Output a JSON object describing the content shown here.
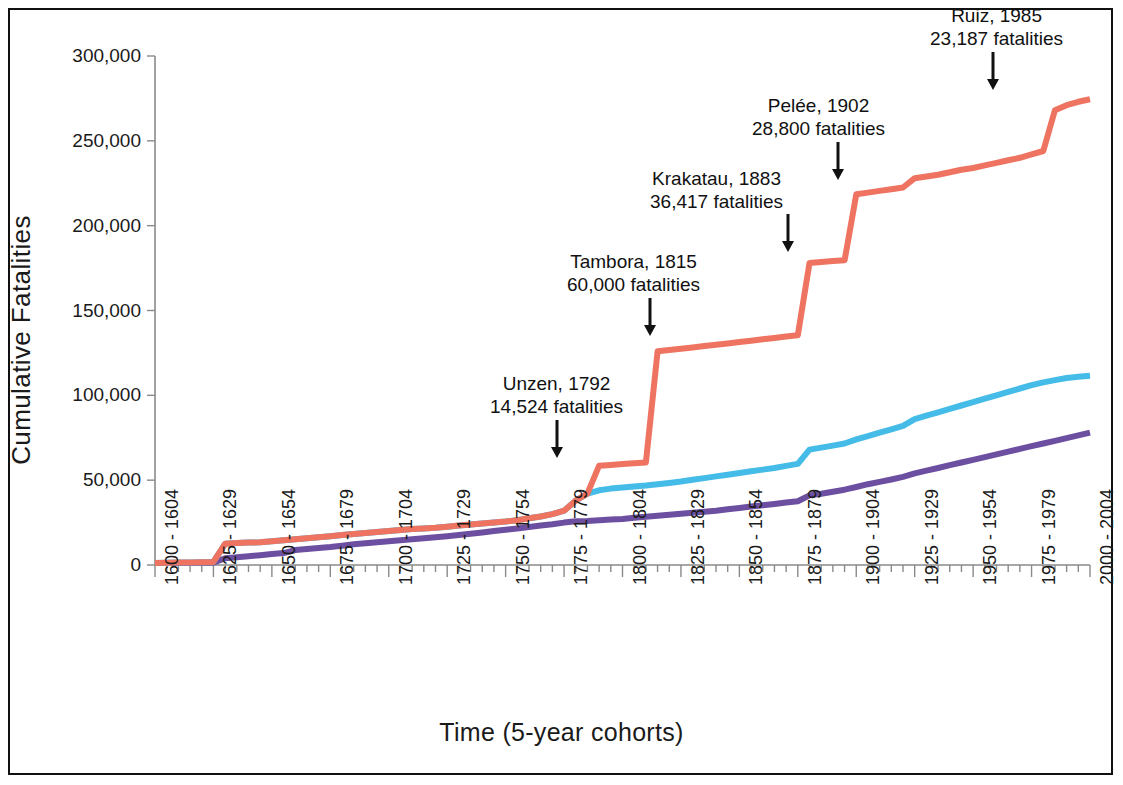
{
  "chart_data": {
    "type": "line",
    "title": "",
    "xlabel": "Time (5-year cohorts)",
    "ylabel": "Cumulative Fatalities",
    "ylim": [
      0,
      300000
    ],
    "ytick_labels": [
      "300,000",
      "250,000",
      "200,000",
      "150,000",
      "100,000",
      "50,000",
      "0"
    ],
    "ytick_values": [
      300000,
      250000,
      200000,
      150000,
      100000,
      50000,
      0
    ],
    "grid": false,
    "legend_position": "none",
    "x_tick_label_step": 5,
    "xtick_labels": [
      "1600 - 1604",
      "1625 - 1629",
      "1650 - 1654",
      "1675 - 1679",
      "1700 - 1704",
      "1725 - 1729",
      "1750 - 1754",
      "1775 - 1779",
      "1800 - 1804",
      "1825 - 1829",
      "1850 - 1854",
      "1875 - 1879",
      "1900 - 1904",
      "1925 - 1929",
      "1950 - 1954",
      "1975 - 1979",
      "2000 - 2004"
    ],
    "categories": [
      "1600 - 1604",
      "1605 - 1609",
      "1610 - 1614",
      "1615 - 1619",
      "1620 - 1624",
      "1625 - 1629",
      "1630 - 1634",
      "1635 - 1639",
      "1640 - 1644",
      "1645 - 1649",
      "1650 - 1654",
      "1655 - 1659",
      "1660 - 1664",
      "1665 - 1669",
      "1670 - 1674",
      "1675 - 1679",
      "1680 - 1684",
      "1685 - 1689",
      "1690 - 1694",
      "1695 - 1699",
      "1700 - 1704",
      "1705 - 1709",
      "1710 - 1714",
      "1715 - 1719",
      "1720 - 1724",
      "1725 - 1729",
      "1730 - 1734",
      "1735 - 1739",
      "1740 - 1744",
      "1745 - 1749",
      "1750 - 1754",
      "1755 - 1759",
      "1760 - 1764",
      "1765 - 1769",
      "1770 - 1774",
      "1775 - 1779",
      "1780 - 1784",
      "1785 - 1789",
      "1790 - 1794",
      "1795 - 1799",
      "1800 - 1804",
      "1805 - 1809",
      "1810 - 1814",
      "1815 - 1819",
      "1820 - 1824",
      "1825 - 1829",
      "1830 - 1834",
      "1835 - 1839",
      "1840 - 1844",
      "1845 - 1849",
      "1850 - 1854",
      "1855 - 1859",
      "1860 - 1864",
      "1865 - 1869",
      "1870 - 1874",
      "1875 - 1879",
      "1880 - 1884",
      "1885 - 1889",
      "1890 - 1894",
      "1895 - 1899",
      "1900 - 1904",
      "1905 - 1909",
      "1910 - 1914",
      "1915 - 1919",
      "1920 - 1924",
      "1925 - 1929",
      "1930 - 1934",
      "1935 - 1939",
      "1940 - 1944",
      "1945 - 1949",
      "1950 - 1954",
      "1955 - 1959",
      "1960 - 1964",
      "1965 - 1969",
      "1970 - 1974",
      "1975 - 1979",
      "1980 - 1984",
      "1985 - 1989",
      "1990 - 1994",
      "1995 - 1999",
      "2000 - 2004"
    ],
    "series": [
      {
        "name": "total-cumulative-fatalities",
        "color": "#ee7361",
        "values": [
          1200,
          1300,
          1400,
          1500,
          1600,
          1800,
          12500,
          13000,
          13200,
          13400,
          14000,
          14600,
          15200,
          15800,
          16400,
          17000,
          17600,
          18200,
          18800,
          19400,
          20000,
          20600,
          21200,
          21600,
          22000,
          22600,
          23200,
          23800,
          24400,
          25000,
          25600,
          26400,
          27600,
          28600,
          30000,
          32000,
          38000,
          42000,
          58500,
          59000,
          59500,
          60000,
          60500,
          126000,
          126800,
          127400,
          128200,
          129000,
          129800,
          130600,
          131400,
          132200,
          133000,
          133800,
          134600,
          135400,
          178000,
          178600,
          179200,
          179600,
          218500,
          219500,
          220500,
          221500,
          222500,
          228000,
          229000,
          230000,
          231500,
          233000,
          234000,
          235500,
          237000,
          238500,
          240000,
          242000,
          244000,
          268000,
          271000,
          273000,
          274500
        ]
      },
      {
        "name": "mid-series-cumulative-fatalities",
        "color": "#45bce8",
        "values": [
          1200,
          1300,
          1400,
          1500,
          1600,
          1800,
          12500,
          13000,
          13200,
          13400,
          14000,
          14600,
          15200,
          15800,
          16400,
          17000,
          17600,
          18200,
          18800,
          19400,
          20000,
          20600,
          21200,
          21600,
          22000,
          22600,
          23200,
          23800,
          24400,
          25000,
          25600,
          26400,
          27600,
          28600,
          30000,
          32000,
          38000,
          42000,
          44000,
          45000,
          45600,
          46200,
          46800,
          47600,
          48400,
          49200,
          50200,
          51200,
          52200,
          53200,
          54200,
          55200,
          56200,
          57200,
          58400,
          59600,
          68000,
          69200,
          70400,
          71600,
          74000,
          76000,
          78000,
          80000,
          82000,
          86000,
          88000,
          90000,
          92000,
          94000,
          96000,
          98000,
          100000,
          102000,
          104000,
          106000,
          107600,
          109000,
          110200,
          111000,
          111600
        ]
      },
      {
        "name": "low-series-cumulative-fatalities",
        "color": "#6c4fa0",
        "values": [
          1100,
          1150,
          1200,
          1250,
          1300,
          1400,
          4000,
          4600,
          5200,
          5800,
          6400,
          7000,
          8800,
          9400,
          10000,
          10600,
          11400,
          12200,
          12800,
          13400,
          14000,
          14600,
          15200,
          15800,
          16400,
          17000,
          17600,
          18400,
          19200,
          20000,
          20800,
          21600,
          22400,
          23200,
          24000,
          25000,
          25800,
          26000,
          26400,
          26800,
          27200,
          27800,
          28400,
          29000,
          29600,
          30200,
          30800,
          31400,
          32000,
          32800,
          33600,
          34400,
          35200,
          36000,
          36800,
          37600,
          41000,
          42000,
          43200,
          44400,
          46000,
          47600,
          49000,
          50400,
          52000,
          54000,
          55600,
          57200,
          58800,
          60400,
          62000,
          63600,
          65200,
          66800,
          68400,
          70000,
          71600,
          73200,
          74800,
          76400,
          78000
        ]
      }
    ],
    "annotations": [
      {
        "id": "unzen",
        "title": "Unzen, 1792",
        "detail": "14,524 fatalities",
        "text_x": 490,
        "text_y": 372,
        "arrow_x": 557,
        "arrow_y": 420,
        "arrow_len": 38
      },
      {
        "id": "tambora",
        "title": "Tambora, 1815",
        "detail": "60,000 fatalities",
        "text_x": 567,
        "text_y": 250,
        "arrow_x": 650,
        "arrow_y": 298,
        "arrow_len": 38
      },
      {
        "id": "krakatau",
        "title": "Krakatau, 1883",
        "detail": "36,417 fatalities",
        "text_x": 650,
        "text_y": 167,
        "arrow_x": 788,
        "arrow_y": 214,
        "arrow_len": 38
      },
      {
        "id": "pelee",
        "title": "Pelée, 1902",
        "detail": "28,800 fatalities",
        "text_x": 752,
        "text_y": 94,
        "arrow_x": 838,
        "arrow_y": 142,
        "arrow_len": 38
      },
      {
        "id": "ruiz",
        "title": "Ruiz, 1985",
        "detail": "23,187 fatalities",
        "text_x": 930,
        "text_y": 4,
        "arrow_x": 993,
        "arrow_y": 52,
        "arrow_len": 38
      }
    ]
  }
}
